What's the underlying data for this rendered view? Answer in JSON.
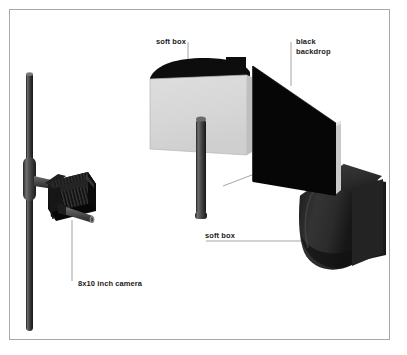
{
  "figure": {
    "type": "technical-illustration",
    "background_color": "#ffffff",
    "frame_color": "#a8a8a8"
  },
  "labels": {
    "softbox_top": "soft box",
    "backdrop_line1": "black",
    "backdrop_line2": "backdrop",
    "softbox_bottom": "soft box",
    "camera": "8x10 inch camera"
  },
  "objects": {
    "camera_stand": {
      "name": "vertical light stand pole",
      "color": "#3b3b3b"
    },
    "camera_body": {
      "name": "8x10 inch view camera with bellows",
      "color": "#141414"
    },
    "softbox_top": {
      "name": "soft box with light grey diffusion panel",
      "panel_color": "#d8d8d8",
      "body_color": "#0d0d0d"
    },
    "backdrop": {
      "name": "black backdrop panel",
      "face_color": "#060606",
      "edge_color": "#c9c9c9"
    },
    "softbox_bottom": {
      "name": "soft box seen from behind",
      "color": "#303030"
    }
  },
  "colors": {
    "black": "#060606",
    "dark_grey": "#303030",
    "mid_grey": "#5a5a5a",
    "light_grey": "#d8d8d8",
    "leader_line": "#9a9a9a",
    "text": "#1a1a1a"
  }
}
